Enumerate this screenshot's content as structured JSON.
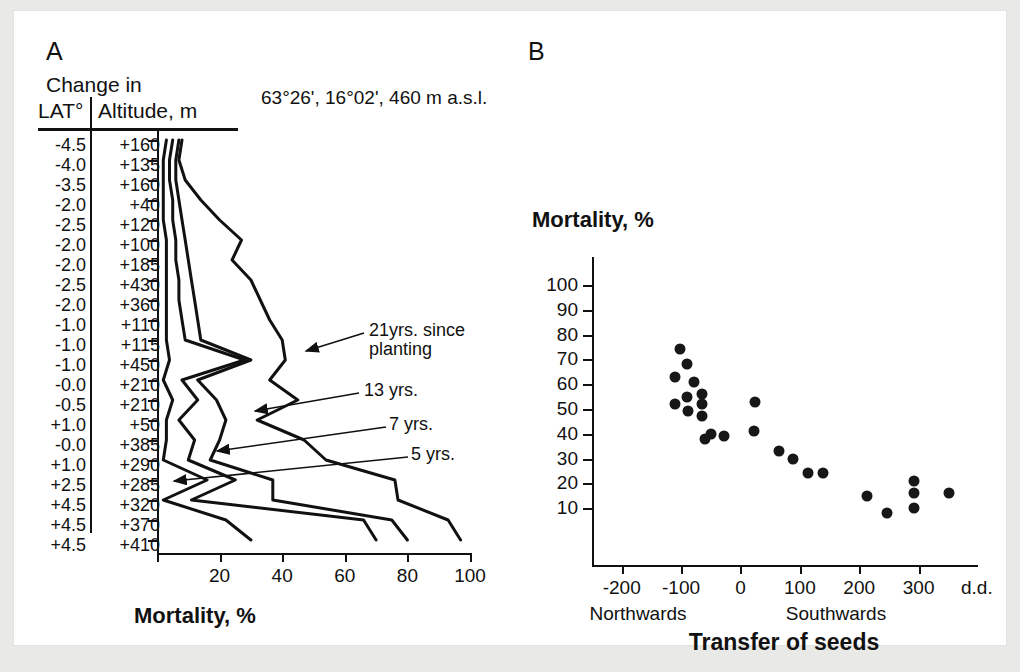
{
  "figure": {
    "background": "#ffffff",
    "page_background": "#e9e9e7",
    "ink": "#111111"
  },
  "panelA": {
    "letter": "A",
    "site_coordinates": "63°26', 16°02', 460 m a.s.l.",
    "table": {
      "header_top": "Change in",
      "header_col1": "LAT°",
      "header_col2": "Altitude, m",
      "rows": [
        {
          "lat": "-4.5",
          "alt": "+160"
        },
        {
          "lat": "-4.0",
          "alt": "+135"
        },
        {
          "lat": "-3.5",
          "alt": "+160"
        },
        {
          "lat": "-2.0",
          "alt": "+40"
        },
        {
          "lat": "-2.5",
          "alt": "+120"
        },
        {
          "lat": "-2.0",
          "alt": "+100"
        },
        {
          "lat": "-2.0",
          "alt": "+185"
        },
        {
          "lat": "-2.5",
          "alt": "+430"
        },
        {
          "lat": "-2.0",
          "alt": "+360"
        },
        {
          "lat": "-1.0",
          "alt": "+110"
        },
        {
          "lat": "-1.0",
          "alt": "+115"
        },
        {
          "lat": "-1.0",
          "alt": "+450"
        },
        {
          "lat": "-0.0",
          "alt": "+210"
        },
        {
          "lat": "-0.5",
          "alt": "+210"
        },
        {
          "lat": "+1.0",
          "alt": "+50"
        },
        {
          "lat": "-0.0",
          "alt": "+385"
        },
        {
          "lat": "+1.0",
          "alt": "+290"
        },
        {
          "lat": "+2.5",
          "alt": "+285"
        },
        {
          "lat": "+4.5",
          "alt": "+320"
        },
        {
          "lat": "+4.5",
          "alt": "+370"
        },
        {
          "lat": "+4.5",
          "alt": "+410"
        }
      ]
    },
    "xaxis": {
      "label": "Mortality, %",
      "ticks": [
        0,
        20,
        40,
        60,
        80,
        100
      ],
      "tick_labels": [
        "",
        "20",
        "40",
        "60",
        "80",
        "100"
      ],
      "range": [
        0,
        100
      ]
    },
    "annotations": [
      {
        "name": "21yrs-label",
        "line1": "21yrs. since",
        "line2": "planting"
      },
      {
        "name": "13yrs-label",
        "line1": "13 yrs.",
        "line2": ""
      },
      {
        "name": "7yrs-label",
        "line1": "7 yrs.",
        "line2": ""
      },
      {
        "name": "5yrs-label",
        "line1": "5 yrs.",
        "line2": ""
      }
    ]
  },
  "panelB": {
    "letter": "B",
    "yaxis": {
      "label": "Mortality, %",
      "ticks": [
        100,
        90,
        80,
        70,
        60,
        50,
        40,
        30,
        20,
        10
      ],
      "range": [
        0,
        100
      ]
    },
    "xaxis": {
      "label": "Transfer of seeds",
      "unit_label": "d.d.",
      "ticks": [
        -200,
        -100,
        0,
        100,
        200,
        300
      ],
      "range": [
        -250,
        400
      ],
      "direction_left": "Northwards",
      "direction_right": "Southwards"
    }
  },
  "chart_data": [
    {
      "type": "line",
      "name": "panelA-mortality-profiles",
      "title": "63°26', 16°02', 460 m a.s.l.",
      "xlabel": "Mortality, %",
      "ylabel": "Change in LAT° / Altitude, m",
      "xlim": [
        0,
        100
      ],
      "grid": false,
      "legend": [
        "21yrs. since planting",
        "13 yrs.",
        "7 yrs.",
        "5 yrs."
      ],
      "categories": [
        "-4.5 / +160",
        "-4.0 / +135",
        "-3.5 / +160",
        "-2.0 / +40",
        "-2.5 / +120",
        "-2.0 / +100",
        "-2.0 / +185",
        "-2.5 / +430",
        "-2.0 / +360",
        "-1.0 / +110",
        "-1.0 / +115",
        "-1.0 / +450",
        "-0.0 / +210",
        "-0.5 / +210",
        "+1.0 / +50",
        "-0.0 / +385",
        "+1.0 / +290",
        "+2.5 / +285",
        "+4.5 / +320",
        "+4.5 / +370",
        "+4.5 / +410"
      ],
      "series": [
        {
          "name": "5 yrs.",
          "values": [
            3,
            2,
            2,
            2,
            2,
            3,
            3,
            3,
            3,
            3,
            3,
            4,
            2,
            5,
            3,
            3,
            2,
            16,
            2,
            22,
            30
          ]
        },
        {
          "name": "7 yrs.",
          "values": [
            5,
            4,
            4,
            5,
            5,
            6,
            6,
            7,
            7,
            8,
            9,
            28,
            8,
            13,
            7,
            12,
            10,
            25,
            11,
            66,
            70
          ]
        },
        {
          "name": "13 yrs.",
          "values": [
            7,
            6,
            6,
            7,
            8,
            9,
            10,
            11,
            12,
            13,
            14,
            30,
            13,
            19,
            22,
            20,
            17,
            37,
            37,
            75,
            80
          ]
        },
        {
          "name": "21yrs. since planting",
          "values": [
            8,
            7,
            9,
            14,
            20,
            27,
            24,
            30,
            33,
            36,
            40,
            41,
            36,
            45,
            32,
            47,
            54,
            76,
            77,
            93,
            97
          ]
        }
      ]
    },
    {
      "type": "scatter",
      "name": "panelB-mortality-vs-transfer",
      "title": "",
      "xlabel": "Transfer of seeds",
      "ylabel": "Mortality, %",
      "xlim": [
        -250,
        400
      ],
      "ylim": [
        0,
        100
      ],
      "grid": false,
      "xunit": "d.d.",
      "points": [
        {
          "x": -101,
          "y": 74
        },
        {
          "x": -90,
          "y": 68
        },
        {
          "x": -110,
          "y": 63
        },
        {
          "x": -79,
          "y": 61
        },
        {
          "x": -110,
          "y": 52
        },
        {
          "x": -90,
          "y": 55
        },
        {
          "x": -89,
          "y": 49
        },
        {
          "x": -65,
          "y": 56
        },
        {
          "x": -65,
          "y": 52
        },
        {
          "x": -65,
          "y": 47
        },
        {
          "x": -50,
          "y": 40
        },
        {
          "x": -60,
          "y": 38
        },
        {
          "x": -28,
          "y": 39
        },
        {
          "x": 24,
          "y": 53
        },
        {
          "x": 22,
          "y": 41
        },
        {
          "x": 65,
          "y": 33
        },
        {
          "x": 88,
          "y": 30
        },
        {
          "x": 113,
          "y": 24
        },
        {
          "x": 139,
          "y": 24
        },
        {
          "x": 213,
          "y": 15
        },
        {
          "x": 246,
          "y": 8
        },
        {
          "x": 292,
          "y": 21
        },
        {
          "x": 292,
          "y": 16
        },
        {
          "x": 292,
          "y": 10
        },
        {
          "x": 352,
          "y": 16
        }
      ]
    }
  ]
}
